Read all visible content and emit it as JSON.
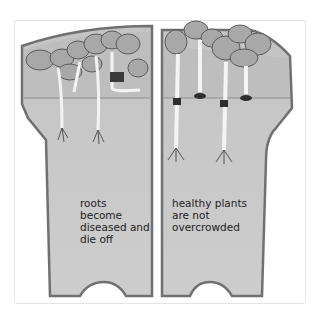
{
  "caption_fragment": "",
  "illustration": {
    "left_pot": {
      "label_lines": [
        "roots",
        "become",
        "diseased and",
        "die off"
      ],
      "state": "overcrowded"
    },
    "right_pot": {
      "label_lines": [
        "healthy plants",
        "are not",
        "overcrowded"
      ],
      "state": "healthy"
    }
  },
  "colors": {
    "pot_fill": "#c9c9c9",
    "pot_edge": "#6e6e6e",
    "soil_band": "#b3b3b3",
    "leaf": "#a9a9a9",
    "stem": "#f2f2f2"
  }
}
